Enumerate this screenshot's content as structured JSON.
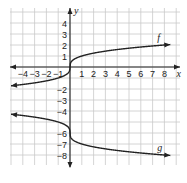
{
  "chart_data": {
    "type": "line",
    "title": "",
    "xlabel": "x",
    "ylabel": "y",
    "xlim": [
      -5,
      8.5
    ],
    "ylim": [
      -8.5,
      4.5
    ],
    "grid": true,
    "x_tick_labels": [
      "−4",
      "−3",
      "−2",
      "−1",
      "1",
      "2",
      "3",
      "4",
      "5",
      "6",
      "7",
      "8"
    ],
    "x_ticks": [
      -4,
      -3,
      -2,
      -1,
      1,
      2,
      3,
      4,
      5,
      6,
      7,
      8
    ],
    "y_tick_labels": [
      "4",
      "3",
      "2",
      "1",
      "−2",
      "−3",
      "−4",
      "−6",
      "−7",
      "−8"
    ],
    "y_ticks": [
      4,
      3,
      2,
      1,
      -2,
      -3,
      -4,
      -6,
      -7,
      -8
    ],
    "series": [
      {
        "name": "f",
        "description": "cube-root style curve through origin",
        "points": [
          [
            -5,
            -1.71
          ],
          [
            -4,
            -1.59
          ],
          [
            -3,
            -1.44
          ],
          [
            -2,
            -1.26
          ],
          [
            -1,
            -1
          ],
          [
            -0.5,
            -0.79
          ],
          [
            -0.1,
            -0.46
          ],
          [
            0,
            0
          ],
          [
            0.1,
            0.46
          ],
          [
            0.5,
            0.79
          ],
          [
            1,
            1
          ],
          [
            2,
            1.26
          ],
          [
            3,
            1.44
          ],
          [
            4,
            1.59
          ],
          [
            5,
            1.71
          ],
          [
            6,
            1.82
          ],
          [
            7,
            1.91
          ],
          [
            8,
            2
          ],
          [
            8.5,
            2.04
          ]
        ]
      },
      {
        "name": "g",
        "description": "reflected and shifted cube-root curve through (0, -6)",
        "points": [
          [
            -5,
            -4.29
          ],
          [
            -4,
            -4.41
          ],
          [
            -3,
            -4.56
          ],
          [
            -2,
            -4.74
          ],
          [
            -1,
            -5
          ],
          [
            -0.5,
            -5.21
          ],
          [
            -0.1,
            -5.54
          ],
          [
            0,
            -6
          ],
          [
            0.1,
            -6.46
          ],
          [
            0.5,
            -6.79
          ],
          [
            1,
            -7
          ],
          [
            2,
            -7.26
          ],
          [
            3,
            -7.44
          ],
          [
            4,
            -7.59
          ],
          [
            5,
            -7.71
          ],
          [
            6,
            -7.82
          ],
          [
            7,
            -7.91
          ],
          [
            8,
            -8
          ],
          [
            8.5,
            -8.04
          ]
        ]
      }
    ],
    "annotations": [
      {
        "text": "f",
        "x": 7.4,
        "y": 2.4
      },
      {
        "text": "g",
        "x": 7.4,
        "y": -7.6
      }
    ]
  }
}
